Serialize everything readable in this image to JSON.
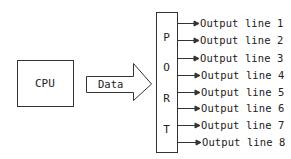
{
  "diagram": {
    "cpu": {
      "label": "CPU"
    },
    "bus": {
      "label": "Data"
    },
    "port": {
      "letters": [
        "P",
        "O",
        "R",
        "T"
      ]
    },
    "outputs": [
      {
        "label": "Output line 1"
      },
      {
        "label": "Output line 2"
      },
      {
        "label": "Output line 3"
      },
      {
        "label": "Output line 4"
      },
      {
        "label": "Output line 5"
      },
      {
        "label": "Output line 6"
      },
      {
        "label": "Output line 7"
      },
      {
        "label": "Output line 8"
      }
    ],
    "colors": {
      "stroke": "#333333",
      "background": "#ffffff"
    }
  }
}
